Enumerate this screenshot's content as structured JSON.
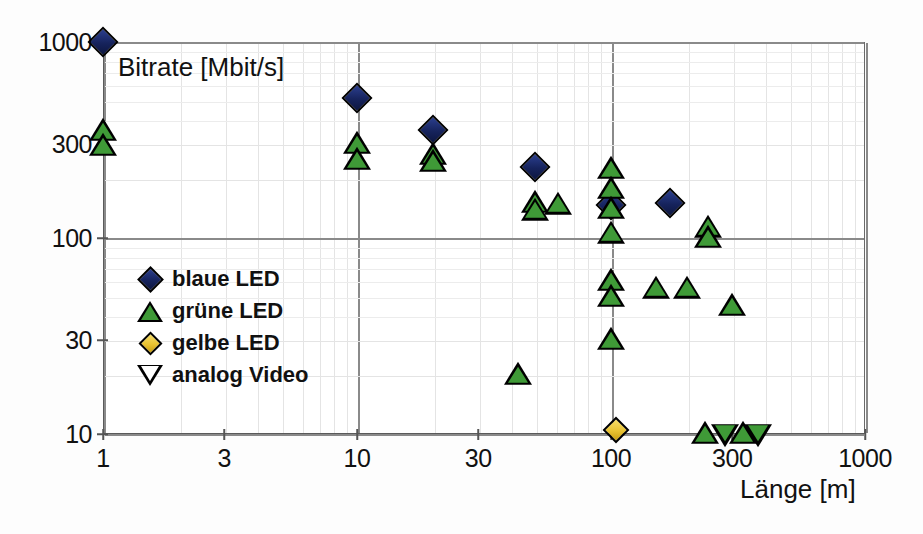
{
  "chart_data": {
    "type": "scatter",
    "title": "",
    "xlabel": "Länge [m]",
    "ylabel": "Bitrate [Mbit/s]",
    "xscale": "log",
    "yscale": "log",
    "xlim": [
      1,
      1000
    ],
    "ylim": [
      10,
      1000
    ],
    "xticks": [
      "1",
      "3",
      "10",
      "30",
      "100",
      "300",
      "1000"
    ],
    "xtick_values": [
      1,
      3,
      10,
      30,
      100,
      300,
      1000
    ],
    "yticks": [
      "10",
      "30",
      "100",
      "300",
      "1000"
    ],
    "ytick_values": [
      10,
      30,
      100,
      300,
      1000
    ],
    "grid": true,
    "legend_position": "left-middle",
    "series": [
      {
        "name": "blaue LED",
        "marker": "diamond",
        "color": "#1b2a6b",
        "points": [
          {
            "x": 1,
            "y": 1000
          },
          {
            "x": 10,
            "y": 520
          },
          {
            "x": 20,
            "y": 355
          },
          {
            "x": 50,
            "y": 230
          },
          {
            "x": 100,
            "y": 148
          },
          {
            "x": 170,
            "y": 150
          }
        ]
      },
      {
        "name": "grüne LED",
        "marker": "triangle-up",
        "color": "#3f9a37",
        "points": [
          {
            "x": 1,
            "y": 350
          },
          {
            "x": 1,
            "y": 295
          },
          {
            "x": 10,
            "y": 300
          },
          {
            "x": 10,
            "y": 250
          },
          {
            "x": 20,
            "y": 265
          },
          {
            "x": 20,
            "y": 243
          },
          {
            "x": 50,
            "y": 150
          },
          {
            "x": 50,
            "y": 138
          },
          {
            "x": 62,
            "y": 148
          },
          {
            "x": 100,
            "y": 225
          },
          {
            "x": 100,
            "y": 178
          },
          {
            "x": 100,
            "y": 140
          },
          {
            "x": 100,
            "y": 105
          },
          {
            "x": 100,
            "y": 60
          },
          {
            "x": 100,
            "y": 50
          },
          {
            "x": 100,
            "y": 30
          },
          {
            "x": 150,
            "y": 55
          },
          {
            "x": 200,
            "y": 55
          },
          {
            "x": 240,
            "y": 113
          },
          {
            "x": 240,
            "y": 100
          },
          {
            "x": 300,
            "y": 45
          },
          {
            "x": 43,
            "y": 20
          },
          {
            "x": 235,
            "y": 10
          },
          {
            "x": 330,
            "y": 10
          }
        ]
      },
      {
        "name": "gelbe LED",
        "marker": "diamond",
        "color": "#e8c232",
        "points": [
          {
            "x": 105,
            "y": 10.5
          }
        ]
      },
      {
        "name": "analog Video",
        "marker": "triangle-down",
        "color": "#3f9a37",
        "points": [
          {
            "x": 280,
            "y": 10
          },
          {
            "x": 380,
            "y": 10
          }
        ]
      }
    ]
  },
  "axes": {
    "y_caption": "Bitrate [Mbit/s]",
    "x_caption": "Länge [m]"
  },
  "legend": {
    "items": [
      {
        "label": "blaue LED",
        "symbol": "diamond-blue-icon"
      },
      {
        "label": "grüne LED",
        "symbol": "triangle-up-green-icon"
      },
      {
        "label": "gelbe LED",
        "symbol": "diamond-yellow-icon"
      },
      {
        "label": "analog Video",
        "symbol": "triangle-down-white-icon"
      }
    ]
  },
  "colors": {
    "blue": "#1b2a6b",
    "green": "#3f9a37",
    "yellow": "#e8c232",
    "grid": "#d6d6d6",
    "axis": "#5a5a5a"
  }
}
